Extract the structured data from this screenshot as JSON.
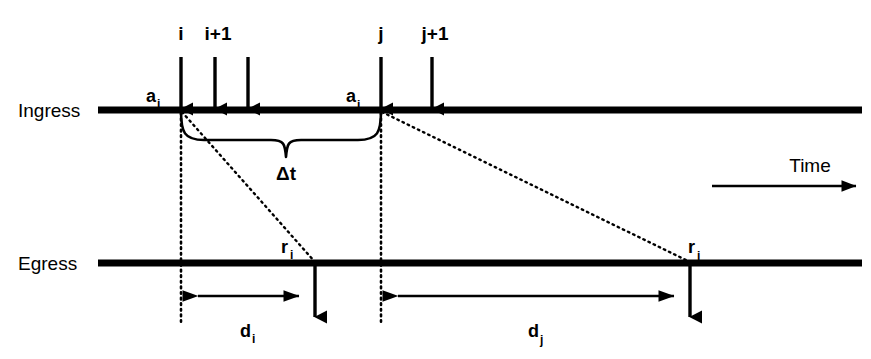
{
  "figure": {
    "background_color": "#ffffff",
    "ink_color": "#000000"
  },
  "axes": {
    "ingress_label": "Ingress",
    "egress_label": "Egress",
    "time_label": "Time"
  },
  "packet_indices": [
    {
      "id": "i",
      "label": "i",
      "x": 181
    },
    {
      "id": "i1",
      "label": "i+1",
      "x": 215
    },
    {
      "id": "j",
      "label": "j",
      "x": 381
    },
    {
      "id": "j1",
      "label": "j+1",
      "x": 432
    }
  ],
  "arrival_arrows": [
    {
      "id": "arrival-i",
      "x": 181
    },
    {
      "id": "arrival-i1",
      "x": 215
    },
    {
      "id": "arrival-i2",
      "x": 248
    },
    {
      "id": "arrival-j",
      "x": 381
    },
    {
      "id": "arrival-j1",
      "x": 432
    }
  ],
  "arrival_times": [
    {
      "id": "a_i",
      "base": "a",
      "sub": "i",
      "x": 146,
      "y": 102
    },
    {
      "id": "a_j",
      "base": "a",
      "sub": "j",
      "x": 346,
      "y": 102
    }
  ],
  "departure_times": [
    {
      "id": "r_i",
      "base": "r",
      "sub": "i",
      "x": 281,
      "y": 253
    },
    {
      "id": "r_j",
      "base": "r",
      "sub": "j",
      "x": 688,
      "y": 253
    }
  ],
  "delays": [
    {
      "id": "d_i",
      "base": "d",
      "sub": "i",
      "label_x": 248,
      "label_y": 337,
      "from_x": 181,
      "to_x": 315
    },
    {
      "id": "d_j",
      "base": "d",
      "sub": "j",
      "label_x": 535,
      "label_y": 337,
      "from_x": 381,
      "to_x": 690
    }
  ],
  "interarrival": {
    "id": "delta-t",
    "label": "Δt",
    "label_x": 285,
    "label_y": 180,
    "from_x": 181,
    "to_x": 381
  },
  "departures": [
    {
      "id": "departure-i",
      "x": 315
    },
    {
      "id": "departure-j",
      "x": 690
    }
  ],
  "geometry": {
    "ingress_y": 110,
    "egress_y": 263,
    "line_start_x": 98,
    "line_end_x": 862,
    "arrow_top_y": 57,
    "guide_bottom_y": 322,
    "time_axis_y": 186,
    "time_axis_from_x": 712,
    "time_axis_to_x": 858,
    "time_label_x": 810,
    "time_label_y": 172
  }
}
